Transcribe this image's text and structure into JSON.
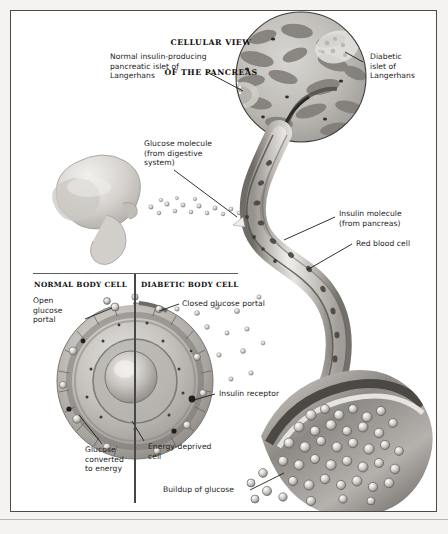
{
  "document": {
    "title": "Cellular View of the Pancreas",
    "type": "medical-illustration",
    "background_color": "#f4f3f1",
    "frame_color": "#4a4a4a",
    "ink_color": "#1b1b1b"
  },
  "heading": {
    "line1": "CELLULAR VIEW",
    "line2": "OF THE PANCREAS"
  },
  "labels": {
    "normal_islet": "Normal insulin-producing\npancreatic islet of\nLangerhans",
    "diabetic_islet": "Diabetic\nislet of\nLangerhans",
    "glucose_molecule": "Glucose molecule\n(from digestive\nsystem)",
    "insulin_molecule": "Insulin molecule\n(from pancreas)",
    "red_blood_cell": "Red blood cell",
    "open_glucose_portal": "Open\nglucose\nportal",
    "closed_glucose_portal": "Closed glucose portal",
    "insulin_receptor": "Insulin receptor",
    "glucose_converted": "Glucose\nconverted\nto energy",
    "energy_deprived": "Energy-deprived\ncell",
    "buildup_of_glucose": "Buildup of glucose"
  },
  "panels": {
    "normal_body_cell": "NORMAL BODY CELL",
    "diabetic_body_cell": "DIABETIC BODY CELL"
  },
  "figures": {
    "pancreas_micrograph": "pancreas-micrograph-circle",
    "stomach": "stomach-duodenum-illustration",
    "blood_vessel": "blood-vessel-s-curve",
    "vessel_cross_section": "blood-vessel-cross-section",
    "normal_cell": "normal-body-cell-half",
    "diabetic_cell": "diabetic-body-cell-half",
    "glucose_stream": "glucose-molecule-stream"
  }
}
